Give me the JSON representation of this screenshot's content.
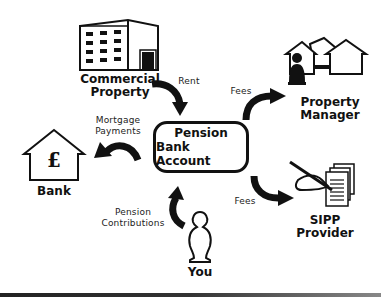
{
  "center": {
    "line1": "Pension",
    "line2": "Bank Account"
  },
  "nodes": {
    "commercial_property": {
      "line1": "Commercial",
      "line2": "Property",
      "icon": "office-building-icon"
    },
    "property_manager": {
      "line1": "Property",
      "line2": "Manager",
      "icon": "houses-with-person-icon"
    },
    "bank": {
      "label": "Bank",
      "icon": "house-pound-icon",
      "symbol": "£"
    },
    "sipp_provider": {
      "line1": "SIPP",
      "line2": "Provider",
      "icon": "hand-signing-documents-icon"
    },
    "you": {
      "label": "You",
      "icon": "person-icon"
    }
  },
  "flows": [
    {
      "from": "Commercial Property",
      "to": "Pension Bank Account",
      "line1": "Rent",
      "line2": ""
    },
    {
      "from": "Pension Bank Account",
      "to": "Property Manager",
      "line1": "Fees",
      "line2": ""
    },
    {
      "from": "Pension Bank Account",
      "to": "Bank",
      "line1": "Mortgage",
      "line2": "Payments"
    },
    {
      "from": "Pension Bank Account",
      "to": "SIPP Provider",
      "line1": "Fees",
      "line2": ""
    },
    {
      "from": "You",
      "to": "Pension Bank Account",
      "line1": "Pension",
      "line2": "Contributions"
    }
  ]
}
